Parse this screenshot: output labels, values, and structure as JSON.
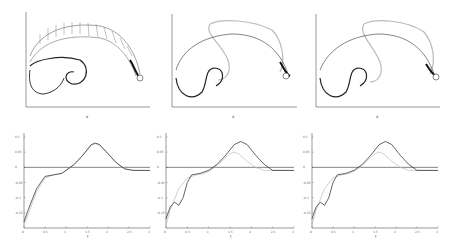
{
  "figure": {
    "layout": "2 rows x 3 columns",
    "top_row_description": "Vortex-sheet / vector-field snapshots in x-y plane with a circular body at right",
    "bottom_row_description": "Time histories of a quantity vs t, black and gray curves with horizontal reference line"
  },
  "chart_data": [
    {
      "id": "top-left",
      "type": "scatter",
      "title": "",
      "xlabel": "x",
      "ylabel": "y",
      "xticks": [
        "-0.6",
        "-0.4",
        "-0.2",
        "0",
        "0.2",
        "0.4",
        "0.6",
        "0.8",
        "1"
      ],
      "yticks": [
        "0.04",
        "0.03",
        "0.02",
        "0.01",
        "0",
        "-0.01",
        "-0.02",
        "-0.03"
      ],
      "xlim": [
        -0.65,
        1.05
      ],
      "ylim": [
        -0.035,
        0.045
      ],
      "grid": false,
      "notes": "Arrow field along arc from left spiral (x~-0.6..0) over top (y~0.03) to circle at x~0.95,y~0"
    },
    {
      "id": "top-middle",
      "type": "scatter",
      "title": "",
      "xlabel": "x",
      "ylabel": "y",
      "xticks": [
        "-0.6",
        "-0.4",
        "-0.2",
        "0",
        "0.2",
        "0.4",
        "0.6",
        "0.8",
        "1"
      ],
      "yticks": [
        "0.04",
        "0.03",
        "0.02",
        "0.01",
        "0",
        "-0.01",
        "-0.02",
        "-0.03"
      ],
      "xlim": [
        -0.65,
        1.05
      ],
      "ylim": [
        -0.035,
        0.045
      ],
      "grid": false,
      "notes": "Black arrow field plus lighter gray secondary sheet looping above"
    },
    {
      "id": "top-right",
      "type": "scatter",
      "title": "",
      "xlabel": "x",
      "ylabel": "y",
      "xticks": [
        "-0.6",
        "-0.4",
        "-0.2",
        "0",
        "0.2",
        "0.4",
        "0.6",
        "0.8",
        "1"
      ],
      "yticks": [
        "0.04",
        "0.03",
        "0.02",
        "0.01",
        "0",
        "-0.01",
        "-0.02",
        "-0.03"
      ],
      "xlim": [
        -0.65,
        1.05
      ],
      "ylim": [
        -0.035,
        0.045
      ],
      "grid": false,
      "notes": "Similar to middle with gray secondary sheet"
    },
    {
      "id": "bottom-left",
      "type": "line",
      "title": "",
      "xlabel": "t",
      "ylabel": "",
      "xticks": [
        "0",
        "0.5",
        "1",
        "1.5",
        "2",
        "2.5",
        "3"
      ],
      "yticks": [
        "0.1",
        "0.05",
        "0",
        "-0.05",
        "-0.1",
        "-0.15"
      ],
      "xlim": [
        0,
        3
      ],
      "ylim": [
        -0.2,
        0.1
      ],
      "reference_line_y": 0,
      "grid": false,
      "series": [
        {
          "name": "black",
          "x": [
            0,
            0.1,
            0.3,
            0.5,
            0.7,
            0.9,
            1.0,
            1.2,
            1.4,
            1.6,
            1.7,
            1.8,
            2.0,
            2.2,
            2.4,
            2.6,
            3.0
          ],
          "y": [
            -0.18,
            -0.14,
            -0.07,
            -0.03,
            -0.025,
            -0.02,
            -0.01,
            0.01,
            0.04,
            0.075,
            0.08,
            0.075,
            0.045,
            0.015,
            -0.005,
            -0.01,
            -0.01
          ]
        },
        {
          "name": "gray",
          "x": [
            0,
            0.1,
            0.3,
            0.5,
            0.7,
            0.9,
            1.0,
            1.2,
            1.4,
            1.6,
            1.7,
            1.8,
            2.0,
            2.2,
            2.4,
            2.6,
            3.0
          ],
          "y": [
            -0.19,
            -0.155,
            -0.08,
            -0.035,
            -0.025,
            -0.02,
            -0.01,
            0.01,
            0.04,
            0.072,
            0.078,
            0.073,
            0.045,
            0.015,
            -0.005,
            -0.01,
            -0.01
          ]
        }
      ]
    },
    {
      "id": "bottom-middle",
      "type": "line",
      "title": "",
      "xlabel": "t",
      "ylabel": "",
      "xticks": [
        "0",
        "0.5",
        "1",
        "1.5",
        "2",
        "2.5",
        "3"
      ],
      "yticks": [
        "0.1",
        "0.05",
        "0",
        "-0.05",
        "-0.1",
        "-0.15"
      ],
      "xlim": [
        0,
        3
      ],
      "ylim": [
        -0.2,
        0.1
      ],
      "reference_line_y": 0,
      "grid": false,
      "series": [
        {
          "name": "black",
          "x": [
            0,
            0.1,
            0.2,
            0.3,
            0.4,
            0.5,
            0.6,
            0.8,
            1.0,
            1.2,
            1.4,
            1.6,
            1.75,
            1.9,
            2.1,
            2.3,
            2.5,
            3.0
          ],
          "y": [
            -0.17,
            -0.13,
            -0.115,
            -0.125,
            -0.1,
            -0.05,
            -0.025,
            -0.02,
            -0.01,
            0.01,
            0.04,
            0.075,
            0.085,
            0.075,
            0.04,
            0.01,
            -0.01,
            -0.01
          ]
        },
        {
          "name": "gray",
          "x": [
            0,
            0.1,
            0.3,
            0.5,
            0.7,
            0.9,
            1.1,
            1.3,
            1.5,
            1.6,
            1.7,
            1.9,
            2.1,
            2.3,
            3.0
          ],
          "y": [
            -0.19,
            -0.14,
            -0.07,
            -0.035,
            -0.025,
            -0.02,
            -0.005,
            0.02,
            0.045,
            0.05,
            0.045,
            0.02,
            0.0,
            -0.01,
            -0.01
          ]
        }
      ]
    },
    {
      "id": "bottom-right",
      "type": "line",
      "title": "",
      "xlabel": "t",
      "ylabel": "",
      "xticks": [
        "0",
        "0.5",
        "1",
        "1.5",
        "2",
        "2.5",
        "3"
      ],
      "yticks": [
        "0.1",
        "0.05",
        "0",
        "-0.05",
        "-0.1",
        "-0.15"
      ],
      "xlim": [
        0,
        3
      ],
      "ylim": [
        -0.2,
        0.1
      ],
      "reference_line_y": 0,
      "grid": false,
      "series": [
        {
          "name": "black",
          "x": [
            0,
            0.1,
            0.2,
            0.3,
            0.4,
            0.5,
            0.6,
            0.8,
            1.0,
            1.2,
            1.4,
            1.6,
            1.75,
            1.9,
            2.1,
            2.3,
            2.5,
            3.0
          ],
          "y": [
            -0.17,
            -0.13,
            -0.115,
            -0.125,
            -0.1,
            -0.05,
            -0.025,
            -0.02,
            -0.01,
            0.01,
            0.04,
            0.075,
            0.085,
            0.075,
            0.04,
            0.01,
            -0.01,
            -0.01
          ]
        },
        {
          "name": "gray",
          "x": [
            0,
            0.1,
            0.3,
            0.5,
            0.7,
            0.9,
            1.1,
            1.3,
            1.5,
            1.6,
            1.7,
            1.9,
            2.1,
            2.3,
            3.0
          ],
          "y": [
            -0.19,
            -0.14,
            -0.07,
            -0.035,
            -0.025,
            -0.02,
            -0.005,
            0.02,
            0.045,
            0.05,
            0.045,
            0.02,
            0.0,
            -0.01,
            -0.01
          ]
        }
      ]
    }
  ],
  "colors": {
    "primary": "#222222",
    "secondary": "#bbbbbb",
    "axis": "#555555",
    "background": "#ffffff"
  }
}
